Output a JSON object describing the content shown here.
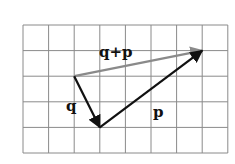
{
  "figure": {
    "type": "vector-addition-diagram",
    "grid": {
      "columns": 8,
      "rows": 5,
      "origin_px": [
        23,
        25
      ],
      "cell_px": 25.6,
      "line_color": "#8a8a8a"
    },
    "vectors": [
      {
        "name": "q",
        "label": "q",
        "from_grid": [
          2,
          2
        ],
        "to_grid": [
          3,
          4
        ],
        "color": "#111111"
      },
      {
        "name": "p",
        "label": "p",
        "from_grid": [
          3,
          4
        ],
        "to_grid": [
          7,
          1
        ],
        "color": "#111111"
      },
      {
        "name": "q_plus_p",
        "label": "q+p",
        "from_grid": [
          2,
          2
        ],
        "to_grid": [
          7,
          1
        ],
        "color": "#8a8a8a"
      }
    ],
    "labels": {
      "q": "q",
      "p": "p",
      "sum": "q+p"
    }
  }
}
